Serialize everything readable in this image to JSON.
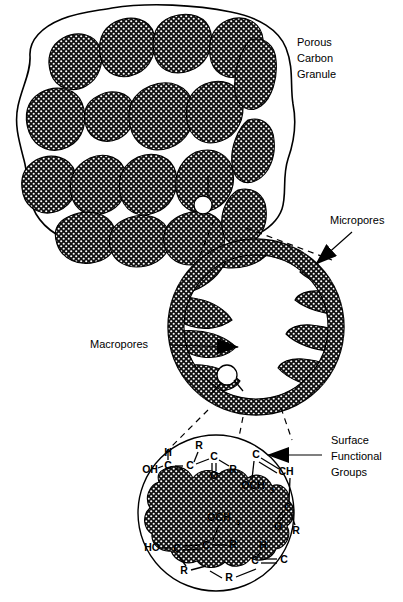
{
  "labels": {
    "granule": {
      "line1": "Porous",
      "line2": "Carbon",
      "line3": "Granule"
    },
    "micropores": "Micropores",
    "macropores": "Macropores",
    "surface_groups": {
      "line1": "Surface",
      "line2": "Functional",
      "line3": "Groups"
    }
  },
  "chemistry": {
    "top_left": [
      {
        "text": "OH",
        "x": 150,
        "y": 470
      },
      {
        "text": "H",
        "x": 168,
        "y": 453
      },
      {
        "text": "C",
        "x": 168,
        "y": 466
      },
      {
        "text": "C",
        "x": 190,
        "y": 466
      },
      {
        "text": "R",
        "x": 199,
        "y": 446
      },
      {
        "text": "C",
        "x": 214,
        "y": 457
      },
      {
        "text": "O",
        "x": 214,
        "y": 476
      },
      {
        "text": "R",
        "x": 233,
        "y": 470
      }
    ],
    "top_right": [
      {
        "text": "C",
        "x": 256,
        "y": 455
      },
      {
        "text": "CH",
        "x": 286,
        "y": 472
      },
      {
        "text": "OCH",
        "x": 253,
        "y": 486,
        "sub": "3"
      },
      {
        "text": "C",
        "x": 288,
        "y": 508
      },
      {
        "text": "O",
        "x": 278,
        "y": 527
      },
      {
        "text": "R",
        "x": 296,
        "y": 531
      }
    ],
    "bottom": [
      {
        "text": "OCH",
        "x": 219,
        "y": 518,
        "sub": "3"
      },
      {
        "text": "HO",
        "x": 152,
        "y": 548
      },
      {
        "text": "C",
        "x": 177,
        "y": 549
      },
      {
        "text": "C",
        "x": 206,
        "y": 546
      },
      {
        "text": "R",
        "x": 233,
        "y": 545
      },
      {
        "text": "R",
        "x": 184,
        "y": 571
      },
      {
        "text": "H",
        "x": 263,
        "y": 546
      },
      {
        "text": "C",
        "x": 255,
        "y": 561
      },
      {
        "text": "C",
        "x": 284,
        "y": 560
      },
      {
        "text": "R",
        "x": 229,
        "y": 578
      }
    ]
  },
  "colors": {
    "ink": "#000000",
    "paper": "#ffffff"
  }
}
